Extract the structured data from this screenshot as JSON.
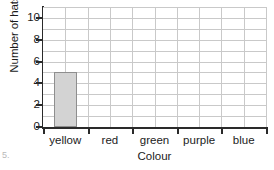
{
  "chart_data": {
    "type": "bar",
    "title": "",
    "xlabel": "Colour",
    "ylabel": "Number of hats",
    "categories": [
      "yellow",
      "red",
      "green",
      "purple",
      "blue"
    ],
    "values": [
      5,
      0,
      0,
      0,
      0
    ],
    "ylim": [
      0,
      11
    ],
    "y_tick_labels": [
      "0",
      "2",
      "4",
      "6",
      "8",
      "10"
    ],
    "y_tick_values": [
      0,
      2,
      4,
      6,
      8,
      10
    ],
    "y_gridline_step": 1,
    "grid": true,
    "legend": "none",
    "bar_fill_color": "#d3d3d3",
    "bar_border_color": "#8e8e8e",
    "grid_color": "#c9c9c9",
    "axis_color": "#2a2a2a",
    "background_color": "#ffffff"
  },
  "artifact": {
    "corner_mark": "5."
  }
}
